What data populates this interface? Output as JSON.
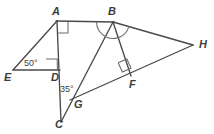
{
  "figure": {
    "background_color": "#ffffff",
    "line_color": "#4a4a4a",
    "mark_color": "#6a6a6a",
    "label_color": "#3d3d3d"
  },
  "points": [
    {
      "id": "A",
      "label": "A",
      "x": 57,
      "y": 21,
      "label_x": 52,
      "label_y": 6
    },
    {
      "id": "B",
      "label": "B",
      "x": 113,
      "y": 22,
      "label_x": 108,
      "label_y": 6
    },
    {
      "id": "H",
      "label": "H",
      "x": 193,
      "y": 45,
      "label_x": 199,
      "label_y": 39
    },
    {
      "id": "E",
      "label": "E",
      "x": 13,
      "y": 70,
      "label_x": 5,
      "label_y": 72
    },
    {
      "id": "D",
      "label": "D",
      "x": 57,
      "y": 70,
      "label_x": 52,
      "label_y": 72
    },
    {
      "id": "F",
      "label": "F",
      "x": 131,
      "y": 76,
      "label_x": 129,
      "label_y": 79
    },
    {
      "id": "G",
      "label": "G",
      "x": 78,
      "y": 97,
      "label_x": 74,
      "label_y": 99
    },
    {
      "id": "C",
      "label": "C",
      "x": 61,
      "y": 122,
      "label_x": 56,
      "label_y": 119
    }
  ],
  "segments": [
    {
      "name": "segment-EA",
      "from": "E",
      "to": "A"
    },
    {
      "name": "segment-ED",
      "from": "E",
      "to": "D"
    },
    {
      "name": "segment-AC",
      "from": "A",
      "to": "C"
    },
    {
      "name": "segment-AB",
      "from": "A",
      "to": "B"
    },
    {
      "name": "segment-BH",
      "from": "B",
      "to": "H"
    },
    {
      "name": "segment-BC",
      "from": "B",
      "to": "C"
    },
    {
      "name": "segment-BF",
      "from": "B",
      "to": "F"
    },
    {
      "name": "segment-GH",
      "from": "G",
      "to": "H"
    }
  ],
  "angle_labels": [
    {
      "name": "angle-E-50",
      "value": "50°",
      "vertex": "E",
      "x": 24,
      "y": 60
    },
    {
      "name": "angle-G-35",
      "value": "35°",
      "vertex": "G",
      "x": 61,
      "y": 85
    }
  ],
  "right_angle_marks": [
    {
      "name": "right-angle-at-A",
      "vertex": "A",
      "note": "between AB and AD"
    },
    {
      "name": "right-angle-at-D",
      "vertex": "D",
      "note": "between DE and DA"
    },
    {
      "name": "right-angle-at-F",
      "vertex": "F",
      "note": "between BF and GH"
    }
  ],
  "arc_marks": [
    {
      "name": "arc-angle-ABG",
      "vertex": "B",
      "note": "congruent angle arc"
    },
    {
      "name": "arc-angle-GBH",
      "vertex": "B",
      "note": "congruent angle arc"
    }
  ]
}
